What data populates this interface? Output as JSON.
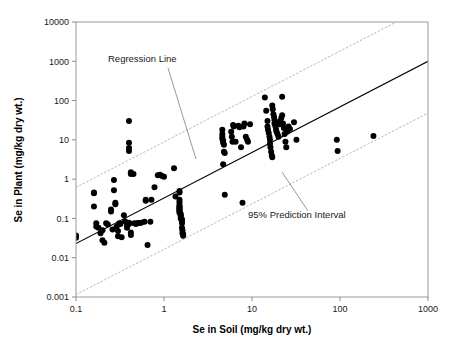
{
  "chart_data": {
    "type": "scatter",
    "title": "",
    "xlabel": "Se in Soil (mg/kg dry wt.)",
    "ylabel": "Se in Plant (mg/kg dry wt.)",
    "xscale": "log",
    "yscale": "log",
    "xlim": [
      0.1,
      1000
    ],
    "ylim": [
      0.001,
      10000
    ],
    "grid": false,
    "xticks": [
      "0.1",
      "1",
      "10",
      "100",
      "1000"
    ],
    "xtick_values": [
      0.1,
      1,
      10,
      100,
      1000
    ],
    "yticks": [
      "0.001",
      "0.01",
      "0.1",
      "1",
      "10",
      "100",
      "1000",
      "10000"
    ],
    "ytick_values": [
      0.001,
      0.01,
      0.1,
      1,
      10,
      100,
      1000,
      10000
    ],
    "annotations": [
      {
        "name": "regression-line-label",
        "text": "Regression Line",
        "x_px": 108,
        "y_px": 62,
        "leader_from": [
          168,
          68
        ],
        "leader_to": [
          196,
          159
        ]
      },
      {
        "name": "prediction-interval-label",
        "text": "95% Prediction Interval",
        "x_px": 248,
        "y_px": 218,
        "leader_from": [
          308,
          211
        ],
        "leader_to": [
          282,
          172
        ]
      }
    ],
    "series": [
      {
        "name": "Regression Line",
        "type": "line",
        "style": "solid",
        "color": "#000000",
        "endpoints": [
          [
            0.1,
            0.023
          ],
          [
            1000,
            1000
          ]
        ]
      },
      {
        "name": "95% Prediction Interval (upper)",
        "type": "line",
        "style": "dotted",
        "color": "#b8b8b8",
        "endpoints": [
          [
            0.1,
            0.62
          ],
          [
            1000,
            26000
          ]
        ]
      },
      {
        "name": "95% Prediction Interval (lower)",
        "type": "line",
        "style": "dotted",
        "color": "#b8b8b8",
        "endpoints": [
          [
            0.1,
            0.00115
          ],
          [
            1000,
            48
          ]
        ]
      },
      {
        "name": "Se soil vs Se plant observations",
        "type": "scatter",
        "color": "#000000",
        "marker": "circle",
        "points": [
          [
            0.1,
            0.037
          ],
          [
            0.1,
            0.032
          ],
          [
            0.16,
            0.46
          ],
          [
            0.16,
            0.44
          ],
          [
            0.16,
            0.2
          ],
          [
            0.17,
            0.075
          ],
          [
            0.17,
            0.062
          ],
          [
            0.18,
            0.058
          ],
          [
            0.19,
            0.042
          ],
          [
            0.2,
            0.05
          ],
          [
            0.2,
            0.028
          ],
          [
            0.21,
            0.024
          ],
          [
            0.22,
            0.075
          ],
          [
            0.23,
            0.07
          ],
          [
            0.25,
            0.17
          ],
          [
            0.25,
            0.15
          ],
          [
            0.26,
            0.052
          ],
          [
            0.27,
            0.95
          ],
          [
            0.27,
            0.52
          ],
          [
            0.28,
            0.25
          ],
          [
            0.28,
            0.23
          ],
          [
            0.29,
            0.062
          ],
          [
            0.3,
            0.048
          ],
          [
            0.3,
            0.035
          ],
          [
            0.31,
            0.075
          ],
          [
            0.32,
            0.072
          ],
          [
            0.33,
            0.033
          ],
          [
            0.35,
            0.12
          ],
          [
            0.36,
            0.085
          ],
          [
            0.38,
            0.068
          ],
          [
            0.38,
            0.058
          ],
          [
            0.4,
            0.078
          ],
          [
            0.4,
            0.074
          ],
          [
            0.4,
            0.072
          ],
          [
            0.42,
            0.044
          ],
          [
            0.42,
            0.038
          ],
          [
            0.4,
            30.0
          ],
          [
            0.4,
            8.5
          ],
          [
            0.4,
            6.2
          ],
          [
            0.4,
            5.2
          ],
          [
            0.42,
            1.5
          ],
          [
            0.42,
            1.35
          ],
          [
            0.45,
            1.35
          ],
          [
            0.46,
            0.075
          ],
          [
            0.48,
            0.072
          ],
          [
            0.5,
            0.077
          ],
          [
            0.52,
            0.076
          ],
          [
            0.55,
            0.078
          ],
          [
            0.6,
            0.082
          ],
          [
            0.62,
            0.3
          ],
          [
            0.62,
            0.28
          ],
          [
            0.65,
            0.021
          ],
          [
            0.7,
            0.082
          ],
          [
            0.72,
            0.3
          ],
          [
            0.78,
            0.62
          ],
          [
            0.85,
            1.25
          ],
          [
            0.9,
            1.3
          ],
          [
            0.95,
            1.2
          ],
          [
            1.0,
            1.15
          ],
          [
            1.3,
            1.9
          ],
          [
            1.35,
            0.36
          ],
          [
            1.5,
            0.5
          ],
          [
            1.5,
            0.46
          ],
          [
            1.5,
            0.3
          ],
          [
            1.5,
            0.26
          ],
          [
            1.5,
            0.22
          ],
          [
            1.5,
            0.2
          ],
          [
            1.5,
            0.19
          ],
          [
            1.5,
            0.18
          ],
          [
            1.5,
            0.17
          ],
          [
            1.5,
            0.16
          ],
          [
            1.5,
            0.15
          ],
          [
            1.5,
            0.14
          ],
          [
            1.55,
            0.13
          ],
          [
            1.55,
            0.12
          ],
          [
            1.55,
            0.11
          ],
          [
            1.55,
            0.1
          ],
          [
            1.6,
            0.095
          ],
          [
            1.6,
            0.085
          ],
          [
            1.6,
            0.075
          ],
          [
            1.6,
            0.058
          ],
          [
            1.62,
            0.05
          ],
          [
            1.62,
            0.042
          ],
          [
            1.65,
            0.04
          ],
          [
            1.65,
            0.036
          ],
          [
            4.6,
            14.0
          ],
          [
            4.6,
            12.0
          ],
          [
            4.6,
            10.5
          ],
          [
            4.7,
            9.5
          ],
          [
            4.7,
            8.5
          ],
          [
            4.8,
            7.5
          ],
          [
            4.8,
            5.0
          ],
          [
            4.9,
            4.6
          ],
          [
            4.6,
            18.0
          ],
          [
            4.7,
            2.4
          ],
          [
            4.9,
            0.4
          ],
          [
            5.8,
            16.0
          ],
          [
            5.9,
            12.0
          ],
          [
            6.0,
            9.0
          ],
          [
            6.1,
            24.0
          ],
          [
            6.2,
            22.0
          ],
          [
            6.5,
            9.0
          ],
          [
            7.0,
            23.0
          ],
          [
            7.2,
            21.0
          ],
          [
            7.5,
            6.5
          ],
          [
            7.8,
            0.25
          ],
          [
            8.0,
            22.0
          ],
          [
            8.2,
            26.0
          ],
          [
            8.5,
            12.0
          ],
          [
            8.8,
            10.0
          ],
          [
            9.0,
            9.0
          ],
          [
            9.5,
            25.0
          ],
          [
            14.0,
            120.0
          ],
          [
            14.5,
            55.0
          ],
          [
            15.0,
            30.0
          ],
          [
            15.0,
            22.0
          ],
          [
            15.2,
            18.0
          ],
          [
            15.5,
            15.0
          ],
          [
            15.8,
            12.0
          ],
          [
            16.0,
            10.0
          ],
          [
            16.0,
            8.0
          ],
          [
            16.2,
            6.5
          ],
          [
            16.5,
            5.0
          ],
          [
            16.8,
            4.0
          ],
          [
            17.0,
            3.6
          ],
          [
            17.0,
            75.0
          ],
          [
            17.2,
            60.0
          ],
          [
            17.5,
            45.0
          ],
          [
            17.8,
            38.0
          ],
          [
            18.0,
            32.0
          ],
          [
            18.0,
            26.0
          ],
          [
            18.5,
            22.0
          ],
          [
            18.8,
            18.0
          ],
          [
            19.0,
            16.0
          ],
          [
            19.5,
            14.0
          ],
          [
            20.0,
            12.0
          ],
          [
            20.0,
            28.0
          ],
          [
            20.5,
            25.0
          ],
          [
            21.0,
            30.0
          ],
          [
            21.5,
            36.0
          ],
          [
            22.0,
            42.0
          ],
          [
            22.0,
            125.0
          ],
          [
            22.5,
            26.0
          ],
          [
            23.0,
            20.0
          ],
          [
            23.5,
            14.0
          ],
          [
            24.0,
            9.0
          ],
          [
            24.5,
            6.5
          ],
          [
            25.0,
            16.0
          ],
          [
            26.0,
            22.0
          ],
          [
            27.0,
            19.0
          ],
          [
            30.0,
            28.0
          ],
          [
            32.0,
            10.0
          ],
          [
            92.0,
            10.0
          ],
          [
            94.0,
            5.2
          ],
          [
            240.0,
            12.5
          ]
        ]
      }
    ]
  },
  "axes_geometry": {
    "plot_left_px": 76,
    "plot_right_px": 428,
    "plot_top_px": 22,
    "plot_bottom_px": 297,
    "x_tick_px": [
      89,
      172,
      256,
      340,
      424
    ],
    "y_tick_px": [
      296,
      256,
      217,
      178,
      139,
      100,
      61,
      22
    ]
  }
}
